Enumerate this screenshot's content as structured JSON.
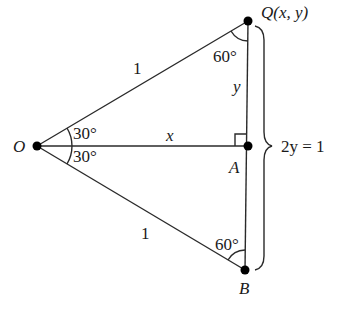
{
  "diagram": {
    "points": {
      "O": {
        "label": "O"
      },
      "Q": {
        "label": "Q(x, y)"
      },
      "A": {
        "label": "A"
      },
      "B": {
        "label": "B"
      }
    },
    "sides": {
      "OQ": "1",
      "OB": "1",
      "OA": "x",
      "QA": "y"
    },
    "angles": {
      "O_upper": "30°",
      "O_lower": "30°",
      "Q": "60°",
      "B": "60°"
    },
    "brace_label": "2y = 1",
    "colors": {
      "line": "#2a2a2a",
      "text": "#1a1a1a",
      "background": "#ffffff"
    }
  }
}
